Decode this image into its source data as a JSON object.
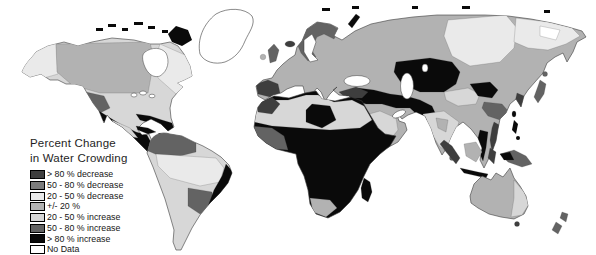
{
  "figure": {
    "type": "choropleth-world-map"
  },
  "legend": {
    "title_line1": "Percent Change",
    "title_line2": "in Water Crowding",
    "items": [
      {
        "key": "dec80",
        "label": "> 80 % decrease",
        "color": "#3e3e3e"
      },
      {
        "key": "dec50_80",
        "label": "50 - 80 % decrease",
        "color": "#7b7b7b"
      },
      {
        "key": "dec20_50",
        "label": "20 - 50 % decrease",
        "color": "#eaeaea"
      },
      {
        "key": "pm20",
        "label": "+/- 20 %",
        "color": "#b2b2b2"
      },
      {
        "key": "inc20_50",
        "label": "20 - 50 % increase",
        "color": "#d7d7d7"
      },
      {
        "key": "inc50_80",
        "label": "50 - 80 % increase",
        "color": "#636363"
      },
      {
        "key": "inc80",
        "label": "> 80 % increase",
        "color": "#0a0a0a"
      },
      {
        "key": "nodata",
        "label": "No Data",
        "color": "#ffffff"
      }
    ]
  },
  "map": {
    "ocean_color": "#ffffff",
    "outline_color": "#3a3a3a",
    "regions": [
      {
        "id": "na-mainland",
        "class": "inc20_50"
      },
      {
        "id": "alaska",
        "class": "dec20_50"
      },
      {
        "id": "canada-west",
        "class": "pm20"
      },
      {
        "id": "canada-east",
        "class": "dec20_50"
      },
      {
        "id": "us-great-basin",
        "class": "inc50_80"
      },
      {
        "id": "us-gulf-coast",
        "class": "inc80"
      },
      {
        "id": "mexico",
        "class": "inc80"
      },
      {
        "id": "mexico-interior",
        "class": "inc20_50"
      },
      {
        "id": "hudson-bay",
        "class": "nodata"
      },
      {
        "id": "great-lakes",
        "class": "nodata"
      },
      {
        "id": "greenland",
        "class": "nodata"
      },
      {
        "id": "arctic-islands",
        "class": "inc80"
      },
      {
        "id": "cuba",
        "class": "inc80"
      },
      {
        "id": "caribbean-islands",
        "class": "inc80"
      },
      {
        "id": "south-america",
        "class": "inc20_50"
      },
      {
        "id": "venezuela-colombia",
        "class": "inc50_80"
      },
      {
        "id": "amazon-basin",
        "class": "dec20_50"
      },
      {
        "id": "paraguay-parana",
        "class": "inc50_80"
      },
      {
        "id": "brazil-east-coast",
        "class": "inc80"
      },
      {
        "id": "eurasia",
        "class": "pm20"
      },
      {
        "id": "scandinavia",
        "class": "inc50_80"
      },
      {
        "id": "british-isles",
        "class": "inc50_80"
      },
      {
        "id": "ireland",
        "class": "pm20"
      },
      {
        "id": "iceland",
        "class": "dec80"
      },
      {
        "id": "iberia",
        "class": "dec80"
      },
      {
        "id": "central-siberia",
        "class": "dec20_50"
      },
      {
        "id": "east-siberia",
        "class": "dec20_50"
      },
      {
        "id": "siberia-nodata",
        "class": "nodata"
      },
      {
        "id": "central-asia",
        "class": "inc80"
      },
      {
        "id": "middle-east",
        "class": "inc80"
      },
      {
        "id": "turkey",
        "class": "dec80"
      },
      {
        "id": "arabia-interior",
        "class": "inc20_50"
      },
      {
        "id": "india",
        "class": "inc20_50"
      },
      {
        "id": "india-interior",
        "class": "pm20"
      },
      {
        "id": "west-china",
        "class": "inc20_50"
      },
      {
        "id": "north-china",
        "class": "inc80"
      },
      {
        "id": "south-china",
        "class": "inc50_80"
      },
      {
        "id": "korea",
        "class": "dec80"
      },
      {
        "id": "vietnam",
        "class": "dec80"
      },
      {
        "id": "thailand",
        "class": "inc80"
      },
      {
        "id": "japan",
        "class": "inc50_80"
      },
      {
        "id": "baltic-sea",
        "class": "nodata"
      },
      {
        "id": "black-sea",
        "class": "nodata"
      },
      {
        "id": "caspian-sea",
        "class": "nodata"
      },
      {
        "id": "aral-sea",
        "class": "nodata"
      },
      {
        "id": "persian-gulf",
        "class": "nodata"
      },
      {
        "id": "novaya-zemlya",
        "class": "inc80"
      },
      {
        "id": "taiwan",
        "class": "inc80"
      },
      {
        "id": "sri-lanka",
        "class": "inc50_80"
      },
      {
        "id": "philippines",
        "class": "inc80"
      },
      {
        "id": "sumatra",
        "class": "dec80"
      },
      {
        "id": "java",
        "class": "inc80"
      },
      {
        "id": "borneo",
        "class": "pm20"
      },
      {
        "id": "sulawesi",
        "class": "dec80"
      },
      {
        "id": "new-guinea",
        "class": "inc50_80"
      },
      {
        "id": "new-guinea-west",
        "class": "inc80"
      },
      {
        "id": "africa",
        "class": "inc80"
      },
      {
        "id": "sahara",
        "class": "inc20_50"
      },
      {
        "id": "libya-chad",
        "class": "inc80"
      },
      {
        "id": "morocco",
        "class": "dec80"
      },
      {
        "id": "west-africa-coast",
        "class": "inc50_80"
      },
      {
        "id": "south-africa",
        "class": "pm20"
      },
      {
        "id": "madagascar",
        "class": "inc80"
      },
      {
        "id": "australia",
        "class": "pm20"
      },
      {
        "id": "australia-east",
        "class": "inc20_50"
      },
      {
        "id": "tasmania",
        "class": "dec80"
      },
      {
        "id": "new-zealand",
        "class": "inc50_80"
      }
    ]
  }
}
